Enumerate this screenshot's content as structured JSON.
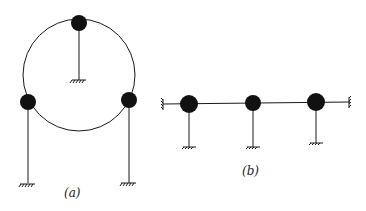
{
  "figure": {
    "panels": [
      {
        "id": "a",
        "label": "(a)",
        "description": "Three masses on a circular ring, each connected to ground by a vertical rod"
      },
      {
        "id": "b",
        "label": "(b)",
        "description": "Three masses on a horizontal line between two walls, each connected to ground by a vertical rod"
      }
    ],
    "colors": {
      "line": "#1a1a1a",
      "mass": "#111111",
      "background": "#ffffff"
    }
  }
}
